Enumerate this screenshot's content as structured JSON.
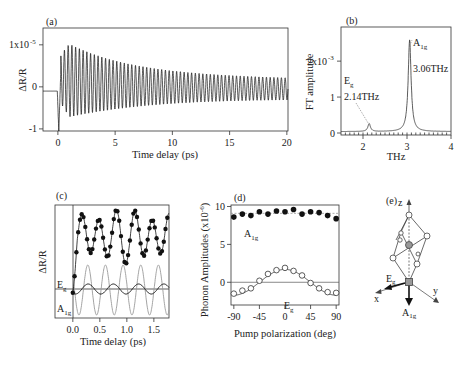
{
  "chart_data": [
    {
      "id": "a",
      "type": "line",
      "panel_label": "(a)",
      "xlabel": "Time delay (ps)",
      "ylabel": "ΔR/R",
      "xlim": [
        -1.3,
        20.1
      ],
      "ylim": [
        -1.05,
        1.4
      ],
      "xticks": [
        0,
        5,
        10,
        15,
        20
      ],
      "xtick_labels": [
        "0",
        "5",
        "10",
        "15",
        "20"
      ],
      "yticks": [
        1,
        0,
        -1
      ],
      "ytick_labels": [
        "1x10",
        "0",
        "-1"
      ],
      "ytick_exponent": "-5",
      "series": [
        {
          "name": "ΔR/R signal",
          "model": "damped oscillation",
          "baseline_before_zero": -0.1,
          "initial_dip": -1.05,
          "frequency_thz": 3.06,
          "peak_amplitude": 1.4,
          "peak_time_ps": 1.0,
          "amplitude_at_20ps": 0.37,
          "offset_at_20ps": -0.05
        }
      ],
      "grid": false
    },
    {
      "id": "b",
      "type": "line",
      "panel_label": "(b)",
      "xlabel": "THz",
      "ylabel": "FT amplitude",
      "xlim": [
        1.5,
        4.0
      ],
      "ylim": [
        0,
        2.95
      ],
      "xticks": [
        2,
        3,
        4
      ],
      "xtick_labels": [
        "2",
        "3",
        "4"
      ],
      "yticks": [
        0,
        1,
        2
      ],
      "ytick_labels": [
        "0",
        "1",
        "2x10"
      ],
      "ytick_exponent": "-3",
      "peaks": [
        {
          "name": "Eg",
          "frequency_thz": 2.14,
          "amplitude": 0.22,
          "label_main": "E",
          "label_sub": "g",
          "label_freq": "2.14THz"
        },
        {
          "name": "A1g",
          "frequency_thz": 3.06,
          "amplitude": 2.55,
          "label_main": "A",
          "label_sub": "1g",
          "label_freq": "3.06THz"
        }
      ],
      "background": 0.04,
      "grid": false
    },
    {
      "id": "c",
      "type": "scatter",
      "panel_label": "(c)",
      "xlabel": "Time delay (ps)",
      "ylabel": "ΔR/R",
      "xlim": [
        -0.33,
        1.78
      ],
      "xticks": [
        0.0,
        0.5,
        1.0,
        1.5
      ],
      "xtick_labels": [
        "0.0",
        "0.5",
        "1.0",
        "1.5"
      ],
      "series": [
        {
          "name": "data (filled points)",
          "style": "filled-circles with fit line",
          "component_frequencies_thz": [
            3.06,
            2.14
          ]
        },
        {
          "name": "Eg",
          "label_main": "E",
          "label_sub": "g",
          "frequency_thz": 2.14,
          "relative_amplitude": 0.2,
          "color": "#111111"
        },
        {
          "name": "A1g",
          "label_main": "A",
          "label_sub": "1g",
          "frequency_thz": 3.06,
          "relative_amplitude": 1.0,
          "color": "#9a9a9a"
        }
      ],
      "grid": false
    },
    {
      "id": "d",
      "type": "scatter",
      "panel_label": "(d)",
      "xlabel": "Pump polarization (deg)",
      "ylabel": "Phonon Amplitudes (x10",
      "ylabel_exponent": "-6",
      "xlim": [
        -95,
        95
      ],
      "ylim": [
        -3,
        10.2
      ],
      "xticks": [
        -90,
        -45,
        0,
        45,
        90
      ],
      "xtick_labels": [
        "-90",
        "-45",
        "0",
        "45",
        "90"
      ],
      "yticks": [
        0,
        5,
        10
      ],
      "ytick_labels": [
        "0",
        "5",
        "10"
      ],
      "x": [
        -90,
        -75,
        -60,
        -45,
        -30,
        -15,
        0,
        15,
        30,
        45,
        60,
        75,
        90
      ],
      "series": [
        {
          "name": "A1g",
          "label_main": "A",
          "label_sub": "1g",
          "marker": "filled",
          "values": [
            8.6,
            9.0,
            8.8,
            9.3,
            9.0,
            9.4,
            9.3,
            9.6,
            9.0,
            9.3,
            9.2,
            8.8,
            8.4
          ],
          "fit_constant": 9.1
        },
        {
          "name": "Eg",
          "label_main": "E",
          "label_sub": "g",
          "marker": "open",
          "values": [
            -1.5,
            -1.1,
            -0.8,
            0.2,
            1.1,
            1.6,
            1.9,
            1.5,
            0.9,
            -0.1,
            -0.8,
            -1.3,
            -1.4
          ],
          "fit_amplitude": 1.7,
          "fit_model": "A*cos(2θ)"
        }
      ],
      "grid": false
    },
    {
      "id": "e",
      "type": "diagram",
      "panel_label": "(e)",
      "axis_labels": {
        "z": "z",
        "x": "x",
        "y": "y"
      },
      "mode_labels": {
        "eg_main": "E",
        "eg_sub": "g",
        "a1g_main": "A",
        "a1g_sub": "1g"
      }
    }
  ]
}
